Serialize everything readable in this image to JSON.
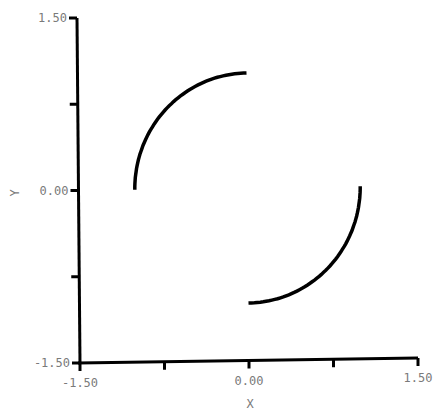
{
  "chart_data": {
    "type": "line",
    "title": "",
    "xlabel": "X",
    "ylabel": "Y",
    "xlim": [
      -1.5,
      1.5
    ],
    "ylim": [
      -1.5,
      1.5
    ],
    "grid": false,
    "legend": null,
    "x_ticks": [
      -1.5,
      -0.75,
      0.0,
      0.75,
      1.5
    ],
    "y_ticks": [
      -1.5,
      -0.75,
      0.0,
      0.75,
      1.5
    ],
    "x_tick_labels": [
      "-1.50",
      "",
      "0.00",
      "",
      "1.50"
    ],
    "y_tick_labels": [
      "-1.50",
      "",
      "0.00",
      "",
      "1.50"
    ],
    "series": [
      {
        "name": "upper-left arc",
        "description": "Quarter circle of radius 1, angle 90 to 180 degrees",
        "radius": 1.0,
        "angle_start_deg": 90,
        "angle_end_deg": 180,
        "x": [
          0.0,
          -0.259,
          -0.5,
          -0.707,
          -0.866,
          -0.966,
          -1.0
        ],
        "y": [
          1.0,
          0.966,
          0.866,
          0.707,
          0.5,
          0.259,
          0.0
        ]
      },
      {
        "name": "lower-right arc",
        "description": "Quarter circle of radius 1, angle 270 to 360 degrees",
        "radius": 1.0,
        "angle_start_deg": 270,
        "angle_end_deg": 360,
        "x": [
          0.0,
          0.259,
          0.5,
          0.707,
          0.866,
          0.966,
          1.0
        ],
        "y": [
          -1.0,
          -0.966,
          -0.866,
          -0.707,
          -0.5,
          -0.259,
          0.0
        ]
      }
    ],
    "color": "#000000"
  }
}
